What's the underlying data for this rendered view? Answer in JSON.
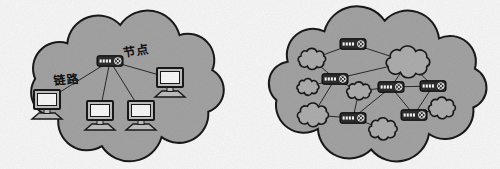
{
  "diagram": {
    "title_semantics": "two-cloud network diagram",
    "colors": {
      "background": "#ffffff",
      "cloud_fill": "#a8a8a8",
      "inner_cloud_fill": "#b3b3b3",
      "stroke": "#1a1a1a",
      "line": "#2a2a2a",
      "device_dark": "#2f2f2f",
      "device_light": "#c6c6c6",
      "screen": "#ffffff",
      "port": "#ffffff"
    },
    "left_cloud": {
      "node_label": "节点",
      "link_label": "链路",
      "outline": {
        "cx": 127,
        "cy": 85,
        "rx": 88,
        "ry": 60,
        "lobes": 9
      },
      "switch": {
        "id": "SW",
        "type": "switch",
        "x": 110,
        "y": 61
      },
      "computers": [
        {
          "id": "PC1",
          "x": 47,
          "y": 100
        },
        {
          "id": "PC2",
          "x": 100,
          "y": 111
        },
        {
          "id": "PC3",
          "x": 141,
          "y": 111
        },
        {
          "id": "PC4",
          "x": 170,
          "y": 78
        }
      ]
    },
    "right_cloud": {
      "outline": {
        "cx": 378,
        "cy": 84,
        "rx": 100,
        "ry": 62,
        "lobes": 10
      },
      "nodes": [
        {
          "id": "R1",
          "type": "router",
          "x": 353,
          "y": 44
        },
        {
          "id": "C1",
          "type": "cloud",
          "x": 312,
          "y": 59,
          "w": 30,
          "h": 19
        },
        {
          "id": "C2",
          "type": "cloud",
          "x": 408,
          "y": 62,
          "w": 48,
          "h": 28
        },
        {
          "id": "R2",
          "type": "router",
          "x": 335,
          "y": 79
        },
        {
          "id": "C3",
          "type": "cloud",
          "x": 308,
          "y": 87,
          "w": 24,
          "h": 15
        },
        {
          "id": "C4",
          "type": "cloud",
          "x": 359,
          "y": 91,
          "w": 27,
          "h": 16
        },
        {
          "id": "R3",
          "type": "router",
          "x": 391,
          "y": 87
        },
        {
          "id": "R4",
          "type": "router",
          "x": 433,
          "y": 86
        },
        {
          "id": "C5",
          "type": "cloud",
          "x": 313,
          "y": 115,
          "w": 34,
          "h": 21
        },
        {
          "id": "R5",
          "type": "router",
          "x": 353,
          "y": 118
        },
        {
          "id": "C6",
          "type": "cloud",
          "x": 383,
          "y": 129,
          "w": 31,
          "h": 20
        },
        {
          "id": "R6",
          "type": "router",
          "x": 414,
          "y": 115
        },
        {
          "id": "C7",
          "type": "cloud",
          "x": 442,
          "y": 108,
          "w": 29,
          "h": 20
        }
      ],
      "edges": [
        [
          "R1",
          "C1"
        ],
        [
          "R1",
          "C2"
        ],
        [
          "C1",
          "R2"
        ],
        [
          "R2",
          "C2"
        ],
        [
          "R2",
          "C3"
        ],
        [
          "R2",
          "C4"
        ],
        [
          "R2",
          "C5"
        ],
        [
          "C4",
          "R3"
        ],
        [
          "C4",
          "R5"
        ],
        [
          "C5",
          "R5"
        ],
        [
          "R5",
          "C6"
        ],
        [
          "R3",
          "R5"
        ],
        [
          "C2",
          "R3"
        ],
        [
          "C2",
          "R4"
        ],
        [
          "R3",
          "R4"
        ],
        [
          "R3",
          "R6"
        ],
        [
          "R4",
          "R6"
        ],
        [
          "R6",
          "C7"
        ]
      ]
    }
  }
}
